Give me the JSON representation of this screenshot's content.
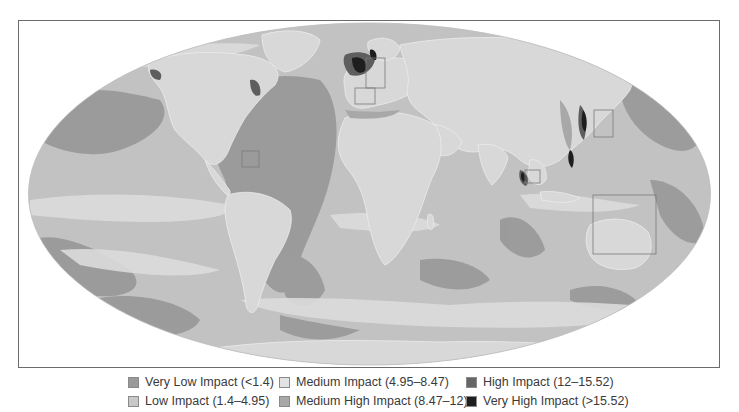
{
  "map": {
    "projection": "Mollweide world map",
    "subject": "Cumulative human impact on marine ecosystems",
    "highlight_boxes": [
      {
        "name": "north-sea-box",
        "region": "North Sea"
      },
      {
        "name": "western-mediterranean-box",
        "region": "Western Mediterranean"
      },
      {
        "name": "caribbean-box",
        "region": "Caribbean"
      },
      {
        "name": "east-china-sea-box",
        "region": "East China Sea / Japan"
      },
      {
        "name": "sri-lanka-box",
        "region": "Bay of Bengal / Sri Lanka"
      },
      {
        "name": "great-barrier-reef-box",
        "region": "Northeast Australia / Coral Sea"
      }
    ]
  },
  "legend": {
    "items": [
      {
        "label": "Very Low Impact (<1.4)",
        "color": "#9a9a9a"
      },
      {
        "label": "Low Impact (1.4–4.95)",
        "color": "#c8c8c8"
      },
      {
        "label": "Medium Impact (4.95–8.47)",
        "color": "#e2e2e2"
      },
      {
        "label": "Medium High Impact (8.47–12)",
        "color": "#a8a8a8"
      },
      {
        "label": "High Impact (12–15.52)",
        "color": "#666666"
      },
      {
        "label": "Very High Impact (>15.52)",
        "color": "#1e1e1e"
      }
    ]
  },
  "colors": {
    "land": "#d8d8d8",
    "border": "#f2f2f2",
    "frame": "#6b6b6b",
    "box": "#7a7a7a"
  }
}
